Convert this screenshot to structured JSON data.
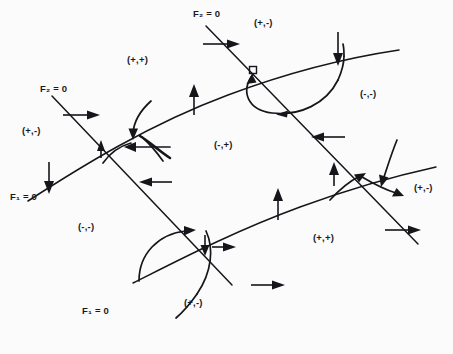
{
  "figure": {
    "kind": "phase-plane-isocline-diagram",
    "background_color": "#fbfbfc",
    "ink_color": "#16161a",
    "width": 453,
    "height": 354
  },
  "isocline_labels": [
    {
      "id": "f2-top",
      "text": "F₂ = 0",
      "x": 193,
      "y": 14,
      "curve": "nullcline-f2-upper"
    },
    {
      "id": "f2-left",
      "text": "F₂ = 0",
      "x": 40,
      "y": 89,
      "curve": "nullcline-f2-lower"
    },
    {
      "id": "f1-left",
      "text": "F₁ = 0",
      "x": 14,
      "y": 197,
      "curve": "nullcline-f1-upper"
    },
    {
      "id": "f1-bottom",
      "text": "F₁ = 0",
      "x": 84,
      "y": 311,
      "curve": "nullcline-f1-lower"
    }
  ],
  "region_labels": [
    {
      "id": "r-top-right",
      "text": "(+,-)",
      "x": 254,
      "y": 23
    },
    {
      "id": "r-upper-left",
      "text": "(+,+)",
      "x": 127,
      "y": 60
    },
    {
      "id": "r-right-upper",
      "text": "(-,-)",
      "x": 362,
      "y": 94
    },
    {
      "id": "r-far-left",
      "text": "(+,-)",
      "x": 24,
      "y": 131
    },
    {
      "id": "r-center",
      "text": "(-,+)",
      "x": 216,
      "y": 145
    },
    {
      "id": "r-far-right",
      "text": "(+,-)",
      "x": 417,
      "y": 188
    },
    {
      "id": "r-lower-left",
      "text": "(-,-)",
      "x": 80,
      "y": 227
    },
    {
      "id": "r-lower-right",
      "text": "(+,+)",
      "x": 315,
      "y": 238
    },
    {
      "id": "r-bottom",
      "text": "(+,-)",
      "x": 186,
      "y": 303
    }
  ],
  "nullclines": {
    "f1_upper": {
      "name": "nullcline-f1-upper",
      "type": "rising-arc",
      "path": "M 28 200 C 90 150, 190 100, 300 72 C 340 62, 372 56, 398 52"
    },
    "f1_lower": {
      "name": "nullcline-f1-lower",
      "type": "rising-arc",
      "path": "M 134 282 C 190 262, 250 235, 320 208 C 358 194, 400 180, 430 170"
    },
    "f2_upper": {
      "name": "nullcline-f2-upper",
      "type": "descending-line",
      "path": "M 207 26 L 416 242"
    },
    "f2_lower": {
      "name": "nullcline-f2-lower",
      "type": "descending-line",
      "path": "M 52 96 L 230 283"
    }
  },
  "equilibria": [
    {
      "id": "eq-upper",
      "x": 253,
      "y": 71,
      "marker": "small-square"
    },
    {
      "id": "eq-left",
      "x": 133,
      "y": 135,
      "marker": "crossing"
    },
    {
      "id": "eq-right",
      "x": 362,
      "y": 174,
      "marker": "crossing"
    },
    {
      "id": "eq-lower",
      "x": 203,
      "y": 240,
      "marker": "crossing"
    }
  ],
  "direction_arrows": [
    {
      "id": "arrow-top-right-down",
      "direction": "down",
      "x": 337,
      "y": 31
    },
    {
      "id": "arrow-f2top-right",
      "direction": "right",
      "x": 204,
      "y": 45
    },
    {
      "id": "arrow-f1up-up",
      "direction": "up",
      "x": 193,
      "y": 88
    },
    {
      "id": "arrow-f2low-right",
      "direction": "right",
      "x": 62,
      "y": 110
    },
    {
      "id": "arrow-mid-right-left",
      "direction": "left",
      "x": 310,
      "y": 136
    },
    {
      "id": "arrow-left-up",
      "direction": "up",
      "x": 100,
      "y": 142
    },
    {
      "id": "arrow-f1up-left-down",
      "direction": "down",
      "x": 48,
      "y": 168
    },
    {
      "id": "arrow-center-left",
      "direction": "left",
      "x": 140,
      "y": 181
    },
    {
      "id": "arrow-right-up",
      "direction": "up",
      "x": 332,
      "y": 166
    },
    {
      "id": "arrow-mid-up",
      "direction": "up",
      "x": 277,
      "y": 198
    },
    {
      "id": "arrow-lowmid-down",
      "direction": "down",
      "x": 204,
      "y": 234
    },
    {
      "id": "arrow-lowmid-right",
      "direction": "right",
      "x": 222,
      "y": 244
    },
    {
      "id": "arrow-bottom-right",
      "direction": "right",
      "x": 264,
      "y": 284
    },
    {
      "id": "arrow-far-right",
      "direction": "right",
      "x": 398,
      "y": 229
    }
  ],
  "trajectories": [
    {
      "id": "traj-upper-loop",
      "description": "curved orbit around upper equilibrium"
    },
    {
      "id": "traj-upper-in",
      "description": "incoming curve from upper right"
    },
    {
      "id": "traj-left-in-top",
      "description": "incoming curve above left equilibrium"
    },
    {
      "id": "traj-left-out",
      "description": "outgoing thick curve right of left equilibrium"
    },
    {
      "id": "traj-left-below",
      "description": "curve below left equilibrium"
    },
    {
      "id": "traj-right-in",
      "description": "incoming curve from upper right of right equilibrium"
    },
    {
      "id": "traj-right-out",
      "description": "outgoing curve toward lower right"
    },
    {
      "id": "traj-right-below",
      "description": "curve approaching right equilibrium from lower left"
    },
    {
      "id": "traj-lower-arc",
      "description": "large arc left of lower equilibrium"
    },
    {
      "id": "traj-lower-out",
      "description": "curve descending below lower equilibrium"
    }
  ]
}
